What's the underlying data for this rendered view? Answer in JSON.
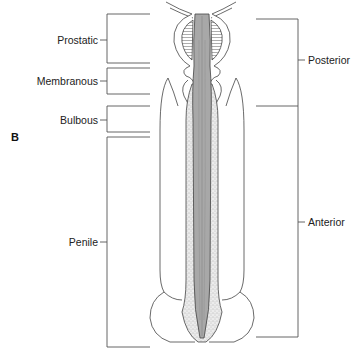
{
  "figure": {
    "panel_label": "B",
    "left_segments": [
      {
        "label": "Prostatic",
        "top": 14,
        "bottom": 63,
        "tick_y": 40
      },
      {
        "label": "Membranous",
        "top": 68,
        "bottom": 94,
        "tick_y": 81
      },
      {
        "label": "Bulbous",
        "top": 106,
        "bottom": 132,
        "tick_y": 120
      },
      {
        "label": "Penile",
        "top": 137,
        "bottom": 347,
        "tick_y": 242
      }
    ],
    "right_segments": [
      {
        "label": "Posterior",
        "top": 19,
        "bottom": 106,
        "tick_y": 60
      },
      {
        "label": "Anterior",
        "top": 106,
        "bottom": 337,
        "tick_y": 222
      }
    ],
    "colors": {
      "line": "#444444",
      "urethra_fill": "#a9a9a9",
      "spongiosum_fill": "#e6e6e6",
      "stipple": "#777777",
      "background": "#ffffff"
    }
  }
}
